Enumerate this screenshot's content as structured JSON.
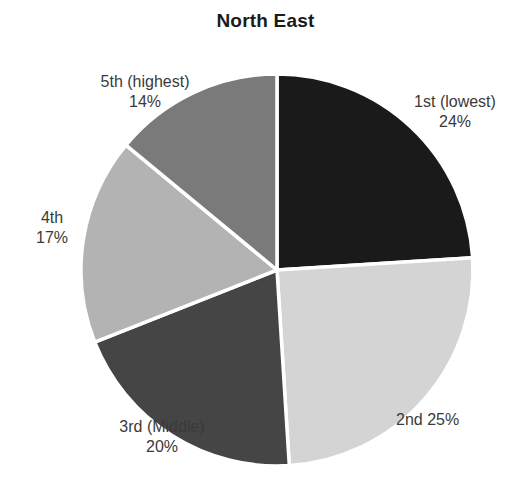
{
  "chart_data": {
    "type": "pie",
    "title": "North East",
    "xlabel": "",
    "ylabel": "",
    "grid": false,
    "legend": "none",
    "label_position": "outside",
    "start_angle_deg": 0,
    "direction": "clockwise",
    "separator_color": "#ffffff",
    "background": "#ffffff",
    "categories": [
      "1st (lowest)",
      "2nd",
      "3rd (Middle)",
      "4th",
      "5th (highest)"
    ],
    "values": [
      24,
      25,
      20,
      17,
      14
    ],
    "value_labels": [
      "24%",
      "25%",
      "20%",
      "17%",
      "14%"
    ],
    "colors": [
      "#1a1a1a",
      "#d4d4d4",
      "#454545",
      "#b3b3b3",
      "#7a7a7a"
    ],
    "slices": [
      {
        "name": "1st (lowest)",
        "value": 24,
        "value_label": "24%",
        "color": "#1a1a1a",
        "label_layout": "stacked"
      },
      {
        "name": "2nd",
        "value": 25,
        "value_label": "25%",
        "color": "#d4d4d4",
        "label_layout": "inline"
      },
      {
        "name": "3rd (Middle)",
        "value": 20,
        "value_label": "20%",
        "color": "#454545",
        "label_layout": "stacked"
      },
      {
        "name": "4th",
        "value": 17,
        "value_label": "17%",
        "color": "#b3b3b3",
        "label_layout": "stacked"
      },
      {
        "name": "5th (highest)",
        "value": 14,
        "value_label": "14%",
        "color": "#7a7a7a",
        "label_layout": "stacked"
      }
    ]
  },
  "geometry": {
    "center_x": 277,
    "center_y": 270,
    "radius": 196
  }
}
